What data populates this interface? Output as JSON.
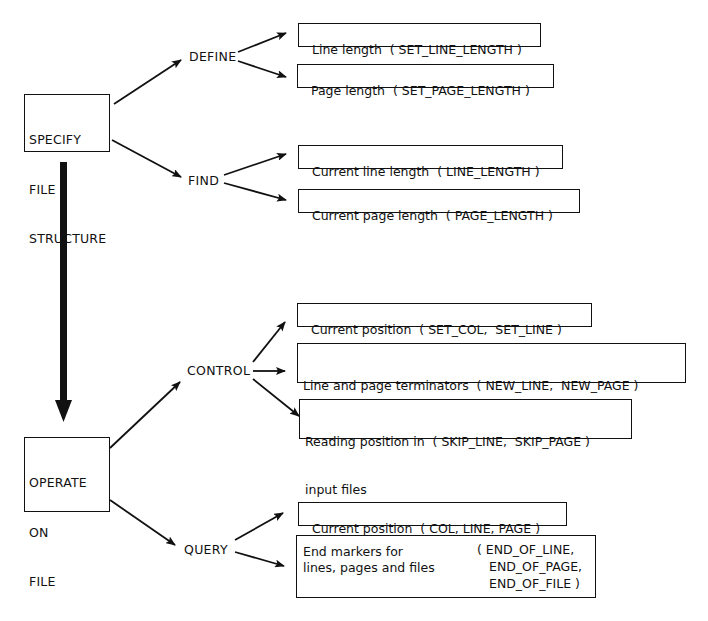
{
  "diagram": {
    "type": "tree",
    "roots": [
      {
        "id": "specify",
        "lines": [
          "SPECIFY",
          "FILE",
          "STRUCTURE"
        ],
        "branches": [
          {
            "label": "DEFINE",
            "leaves": [
              {
                "text": "Line length  ( SET_LINE_LENGTH )"
              },
              {
                "text": "Page length  ( SET_PAGE_LENGTH )"
              }
            ]
          },
          {
            "label": "FIND",
            "leaves": [
              {
                "text": "Current line length  ( LINE_LENGTH )"
              },
              {
                "text": "Current page length  ( PAGE_LENGTH )"
              }
            ]
          }
        ]
      },
      {
        "id": "operate",
        "lines": [
          "OPERATE",
          "ON",
          "FILE",
          "STRUCTURE"
        ],
        "branches": [
          {
            "label": "CONTROL",
            "leaves": [
              {
                "text": "Current position  ( SET_COL,  SET_LINE )"
              },
              {
                "line1": "Line and page terminators  ( NEW_LINE,  NEW_PAGE )",
                "line2": "(output)"
              },
              {
                "line1": "Reading position in  ( SKIP_LINE,  SKIP_PAGE )",
                "line2": "input files"
              }
            ]
          },
          {
            "label": "QUERY",
            "leaves": [
              {
                "text": "Current position  ( COL, LINE, PAGE )"
              },
              {
                "left1": "End markers for",
                "left2": "lines, pages and files",
                "right1": "( END_OF_LINE,",
                "right2": "END_OF_PAGE,",
                "right3": "END_OF_FILE )"
              }
            ]
          }
        ]
      }
    ],
    "flow_arrow": {
      "from": "specify",
      "to": "operate",
      "style": "thick"
    }
  }
}
